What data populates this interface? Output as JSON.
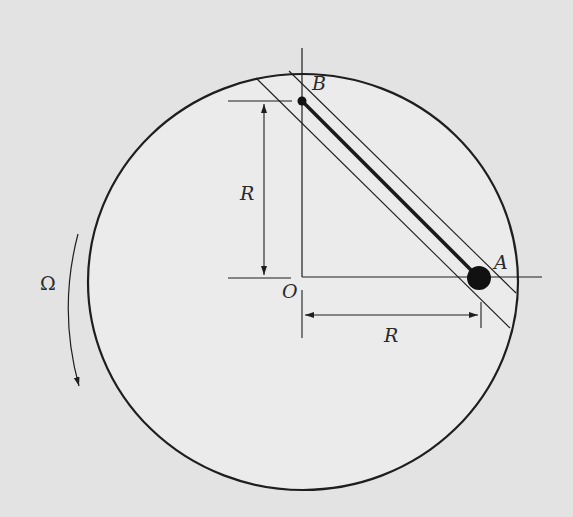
{
  "figure": {
    "type": "rotating-disk-with-rod-in-channel",
    "colors": {
      "background": "#e3e3e3",
      "disk_fill": "#ebebeb",
      "stroke": "#1e1e1e",
      "ball": "#111111"
    },
    "labels": {
      "point_a": "A",
      "point_b": "B",
      "origin": "O",
      "radius_vertical": "R",
      "radius_horizontal": "R",
      "angular_velocity": "Ω"
    },
    "geometry": {
      "disk_center": [
        303,
        282
      ],
      "disk_radii": [
        215,
        208
      ],
      "origin": [
        302,
        277
      ],
      "point_b": [
        302,
        101
      ],
      "point_a": [
        479,
        278
      ],
      "ball_radius": 12,
      "b_dot_radius": 4
    }
  }
}
